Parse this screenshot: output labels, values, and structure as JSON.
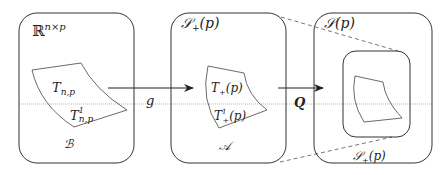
{
  "diagram": {
    "boxes": [
      {
        "id": "box-rnp",
        "label": "ℝ",
        "label_sup": "n×p",
        "inner_label": "ℬ"
      },
      {
        "id": "box-splus",
        "label": "𝒮",
        "label_sub": "+",
        "label_arg": "(p)",
        "inner_label": "𝒜"
      },
      {
        "id": "box-s",
        "label": "𝒮",
        "label_arg": "(p)"
      }
    ],
    "regions": {
      "left_top": {
        "base": "T",
        "sub": "n,p"
      },
      "left_bottom": {
        "base": "T",
        "sup": "1",
        "sub": "n,p"
      },
      "mid_top": {
        "base": "T",
        "sub": "+",
        "arg": "(p)"
      },
      "mid_bottom": {
        "base": "T",
        "sup": "1",
        "sub": "+",
        "arg": "(p)"
      },
      "inner_box_label": {
        "base": "𝒮",
        "sub": "+",
        "arg": "(p)"
      }
    },
    "arrows": [
      {
        "from": "box-rnp",
        "to": "box-splus",
        "label": "g"
      },
      {
        "from": "box-splus",
        "to": "box-s",
        "label": "Q"
      }
    ],
    "colors": {
      "stroke": "#333333",
      "dashed": "#555555",
      "line": "#888888"
    }
  }
}
